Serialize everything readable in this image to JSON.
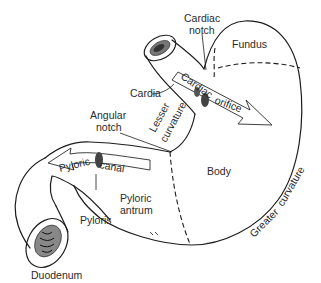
{
  "diagram": {
    "labels": {
      "cardiac_notch_line1": "Cardiac",
      "cardiac_notch_line2": "notch",
      "fundus": "Fundus",
      "cardia": "Cardia",
      "cardiac_orifice_word1": "Cardiac",
      "cardiac_orifice_word2": "orifice",
      "angular_notch_line1": "Angular",
      "angular_notch_line2": "notch",
      "lesser_curvature_line1": "Lesser",
      "lesser_curvature_line2": "curvature",
      "body": "Body",
      "pyloric_canal_word1": "Pyloric",
      "pyloric_canal_word2": "canal",
      "pyloric_antrum_line1": "Pyloric",
      "pyloric_antrum_line2": "antrum",
      "pyloris": "Pyloris",
      "greater_curvature_word1": "Greater",
      "greater_curvature_word2": "curvature",
      "duodenum": "Duodenum"
    },
    "colors": {
      "line": "#1c1c1c",
      "text": "#2a2a2a",
      "background": "#ffffff",
      "shading": "#555555"
    }
  }
}
